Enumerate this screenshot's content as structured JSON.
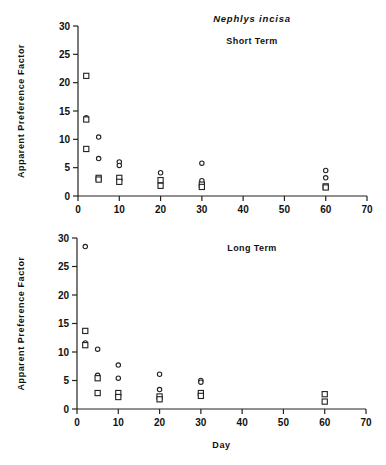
{
  "chart_data": [
    {
      "type": "scatter",
      "title": "Nephlys incisa",
      "subtitle": "Short Term",
      "xlabel": "",
      "ylabel": "Apparent Preference Factor",
      "xlim": [
        0,
        70
      ],
      "ylim": [
        0,
        30
      ],
      "xticks": [
        0,
        10,
        20,
        30,
        40,
        50,
        60,
        70
      ],
      "yticks": [
        0,
        5,
        10,
        15,
        20,
        25,
        30
      ],
      "grid": false,
      "legend": null,
      "series": [
        {
          "name": "circles",
          "marker": "circle",
          "points": [
            [
              2,
              13.8
            ],
            [
              5,
              10.4
            ],
            [
              5,
              6.6
            ],
            [
              10,
              6.0
            ],
            [
              10,
              5.4
            ],
            [
              20,
              4.1
            ],
            [
              30,
              5.8
            ],
            [
              30,
              2.7
            ],
            [
              60,
              4.5
            ],
            [
              60,
              3.2
            ]
          ]
        },
        {
          "name": "squares",
          "marker": "square",
          "points": [
            [
              2,
              21.2
            ],
            [
              2,
              13.5
            ],
            [
              2,
              8.3
            ],
            [
              5,
              3.2
            ],
            [
              5,
              2.9
            ],
            [
              10,
              3.2
            ],
            [
              10,
              2.5
            ],
            [
              20,
              2.8
            ],
            [
              20,
              1.8
            ],
            [
              30,
              2.0
            ],
            [
              30,
              1.6
            ],
            [
              60,
              1.7
            ],
            [
              60,
              1.5
            ]
          ]
        }
      ]
    },
    {
      "type": "scatter",
      "title": "",
      "subtitle": "Long Term",
      "xlabel": "Day",
      "ylabel": "Apparent Preference Factor",
      "xlim": [
        0,
        70
      ],
      "ylim": [
        0,
        30
      ],
      "xticks": [
        0,
        10,
        20,
        30,
        40,
        50,
        60,
        70
      ],
      "yticks": [
        0,
        5,
        10,
        15,
        20,
        25,
        30
      ],
      "grid": false,
      "legend": null,
      "series": [
        {
          "name": "circles",
          "marker": "circle",
          "points": [
            [
              2,
              28.5
            ],
            [
              2,
              11.6
            ],
            [
              5,
              10.5
            ],
            [
              5,
              5.9
            ],
            [
              10,
              7.7
            ],
            [
              10,
              5.4
            ],
            [
              20,
              6.1
            ],
            [
              20,
              3.4
            ],
            [
              30,
              5.0
            ],
            [
              30,
              4.7
            ]
          ]
        },
        {
          "name": "squares",
          "marker": "square",
          "points": [
            [
              2,
              13.7
            ],
            [
              2,
              11.2
            ],
            [
              5,
              5.4
            ],
            [
              5,
              2.8
            ],
            [
              10,
              2.8
            ],
            [
              10,
              2.1
            ],
            [
              20,
              2.2
            ],
            [
              20,
              1.7
            ],
            [
              30,
              2.8
            ],
            [
              30,
              2.3
            ],
            [
              60,
              2.6
            ],
            [
              60,
              1.3
            ]
          ]
        }
      ]
    }
  ],
  "figure": {
    "title": "Nephlys incisa",
    "panels": [
      {
        "label": "Short Term",
        "ylabel": "Apparent Preference Factor"
      },
      {
        "label": "Long Term",
        "ylabel": "Apparent Preference Factor",
        "xlabel": "Day"
      }
    ]
  }
}
